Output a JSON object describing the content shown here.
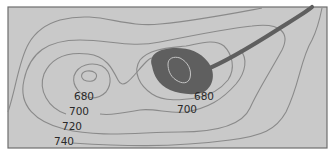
{
  "map": {
    "type": "topographic-contour-map",
    "colors": {
      "background": "#c9c9c9",
      "border": "#6e6e6e",
      "contour": "#8a8a8a",
      "lake": "#5f5f5f",
      "stream": "#5f5f5f",
      "lake_inner_contour": "#c4c4c4",
      "label": "#2a2a2a"
    },
    "contour_labels": [
      {
        "text": "680",
        "x": 74,
        "y": 100
      },
      {
        "text": "700",
        "x": 69,
        "y": 115
      },
      {
        "text": "720",
        "x": 62,
        "y": 130
      },
      {
        "text": "740",
        "x": 54,
        "y": 145
      },
      {
        "text": "680",
        "x": 194,
        "y": 100
      },
      {
        "text": "700",
        "x": 177,
        "y": 113
      }
    ],
    "features": {
      "lake": "dark-shaded-lake",
      "stream": "stream-outlet",
      "hill": "closed-contour-hill"
    }
  }
}
